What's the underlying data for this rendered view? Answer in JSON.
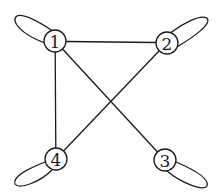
{
  "diagram": {
    "type": "undirected-graph-with-self-loops",
    "nodes": [
      {
        "id": "1",
        "label": "1",
        "x": 55,
        "y": 41,
        "loop": {
          "dir": "upper-left",
          "tip_x": 15,
          "tip_y": 19
        }
      },
      {
        "id": "2",
        "label": "2",
        "x": 167,
        "y": 43,
        "loop": {
          "dir": "upper-right",
          "tip_x": 208,
          "tip_y": 21
        }
      },
      {
        "id": "3",
        "label": "3",
        "x": 165,
        "y": 160,
        "loop": {
          "dir": "lower-right",
          "tip_x": 207,
          "tip_y": 183
        }
      },
      {
        "id": "4",
        "label": "4",
        "x": 56,
        "y": 159,
        "loop": {
          "dir": "lower-left",
          "tip_x": 16,
          "tip_y": 182
        }
      }
    ],
    "edges": [
      {
        "from": "1",
        "to": "2"
      },
      {
        "from": "1",
        "to": "4"
      },
      {
        "from": "1",
        "to": "3"
      },
      {
        "from": "2",
        "to": "4"
      }
    ],
    "self_loops": [
      "1",
      "2",
      "3",
      "4"
    ],
    "node_radius": 11,
    "colors": {
      "stroke": "#1a1a1a",
      "fill": "#ffffff",
      "background": "#ffffff"
    }
  }
}
